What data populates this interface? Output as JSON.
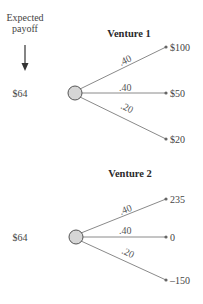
{
  "header": {
    "label_line1": "Expected",
    "label_line2": "payoff",
    "arrow_icon": "down-arrow-icon"
  },
  "ventures": [
    {
      "title": "Venture 1",
      "expected_payoff": "$64",
      "branches": [
        {
          "probability": ".40",
          "payoff": "$100"
        },
        {
          "probability": ".40",
          "payoff": "$50"
        },
        {
          "probability": ".20",
          "payoff": "$20"
        }
      ]
    },
    {
      "title": "Venture 2",
      "expected_payoff": "$64",
      "branches": [
        {
          "probability": ".40",
          "payoff": "235"
        },
        {
          "probability": ".40",
          "payoff": "0"
        },
        {
          "probability": ".20",
          "payoff": "–150"
        }
      ]
    }
  ],
  "colors": {
    "node_fill": "#d6d6d6",
    "branch_line": "#8a8a8a",
    "text": "#444444"
  }
}
